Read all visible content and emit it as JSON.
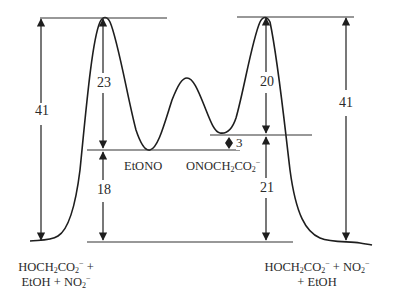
{
  "diagram": {
    "type": "reaction-energy-profile",
    "barriers": {
      "left_total": "41",
      "right_total": "41",
      "left_ts_above_etono": "23",
      "etono_above_reactants": "18",
      "right_ts_above_onoch2co2": "20",
      "onoch2co2_above_products": "21",
      "intermediate_gap": "3"
    },
    "intermediates": {
      "left_min": {
        "base": "EtONO"
      },
      "right_min": {
        "base": "ONOCH",
        "sub1": "2",
        "mid": "CO",
        "sub2": "2",
        "charge": "−"
      }
    },
    "endpoints": {
      "left": {
        "line1": {
          "a": "HOCH",
          "a_sub": "2",
          "b": "CO",
          "b_sub": "2",
          "b_charge": "−",
          "tail": " +"
        },
        "line2": {
          "a": "EtOH + NO",
          "a_sub": "2",
          "a_charge": "−"
        }
      },
      "right": {
        "line1": {
          "a": "HOCH",
          "a_sub": "2",
          "b": "CO",
          "b_sub": "2",
          "b_charge": "−",
          "c": " + NO",
          "c_sub": "2",
          "c_charge": "−"
        },
        "line2": {
          "a": "+ EtOH"
        }
      }
    },
    "colors": {
      "line": "#1e1e1e",
      "background": "#ffffff"
    }
  }
}
